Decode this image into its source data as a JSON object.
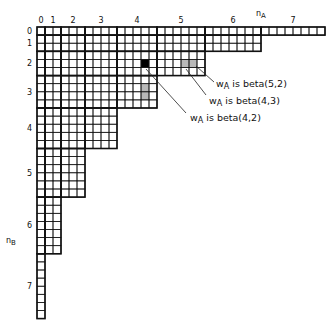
{
  "axes": {
    "x_label": "n_A",
    "x_label_main": "n",
    "x_label_sub": "A",
    "y_label": "n_B",
    "y_label_main": "n",
    "y_label_sub": "B",
    "x_ticks": [
      "0",
      "1",
      "2",
      "3",
      "4",
      "5",
      "6",
      "7"
    ],
    "y_ticks": [
      "0",
      "1",
      "2",
      "3",
      "4",
      "5",
      "6",
      "7"
    ]
  },
  "grid": {
    "origin_x": 37,
    "origin_y": 27,
    "cell_w": 8.0,
    "cell_h": 8.1,
    "block_sizes": [
      1,
      2,
      3,
      4,
      5,
      6,
      7,
      8
    ],
    "staircase_rule": "row block i spans column blocks 0..(7-i)",
    "line_color": "#111111",
    "highlight_color": "#b8b8b8",
    "selected_color": "#000000"
  },
  "highlights": [
    {
      "label": "w_A is beta(4,2)",
      "kind": "selected",
      "cells": [
        [
          13,
          4
        ]
      ]
    },
    {
      "label": "w_A is beta(5,2)",
      "kind": "gray",
      "cells": [
        [
          18,
          4
        ],
        [
          19,
          4
        ]
      ]
    },
    {
      "label": "w_A is beta(4,3)",
      "kind": "gray",
      "cells": [
        [
          13,
          7
        ],
        [
          13,
          8
        ]
      ]
    }
  ],
  "annotations": [
    {
      "w": "w",
      "sub": "A",
      "text": " is beta(5,2)"
    },
    {
      "w": "w",
      "sub": "A",
      "text": " is beta(4,3)"
    },
    {
      "w": "w",
      "sub": "A",
      "text": " is beta(4,2)"
    }
  ]
}
